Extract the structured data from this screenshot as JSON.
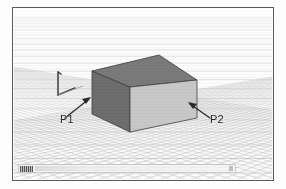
{
  "app": {
    "viewport_title": "3D Perspective Viewport",
    "background_color": "#fafafa",
    "frame_color": "#5a5a5a"
  },
  "grid": {
    "type": "perspective-floor-grid",
    "line_color": "#b6b6b6",
    "major_line_color": "#9a9a9a",
    "horizon_y": 8,
    "vanishing_x": 150,
    "rows": 26,
    "columns": 34
  },
  "axis_gizmo": {
    "name": "axis-indicator",
    "color": "#3a3a3a",
    "x_axis_label": "",
    "y_axis_label": "",
    "z_axis_label": ""
  },
  "solid": {
    "name": "box",
    "top_face_color": "#787878",
    "left_face_color": "#6e6e6e",
    "right_face_color": "#c6c6c6",
    "edge_color": "#3c3c3c"
  },
  "annotations": [
    {
      "label": "P1",
      "arrow": "points-up-right",
      "color": "#262626"
    },
    {
      "label": "P2",
      "arrow": "points-up-left",
      "color": "#262626"
    }
  ],
  "status_bar": {
    "icon": "thumbnail-icon",
    "value": "",
    "placeholder": ""
  }
}
